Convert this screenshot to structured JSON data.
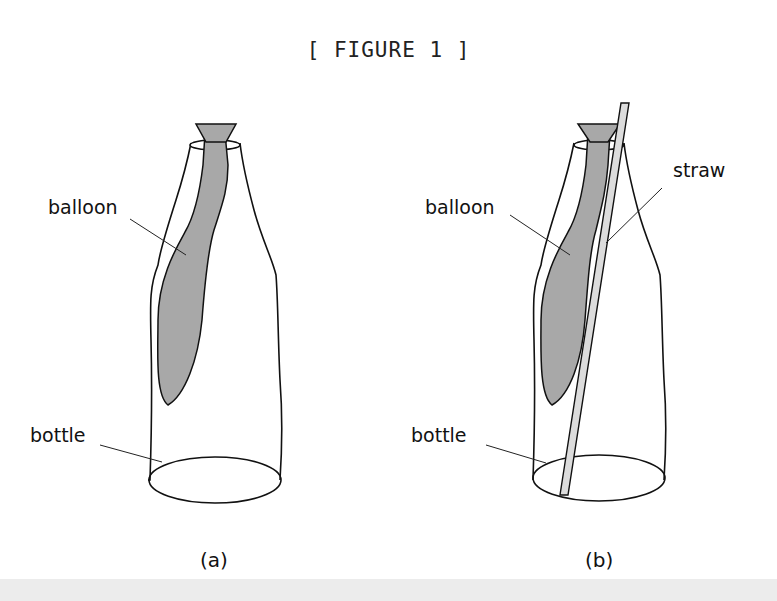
{
  "figure": {
    "title": "[ FIGURE 1 ]",
    "panels": [
      {
        "caption": "(a)",
        "labels": {
          "balloon": "balloon",
          "bottle": "bottle"
        }
      },
      {
        "caption": "(b)",
        "labels": {
          "balloon": "balloon",
          "straw": "straw",
          "bottle": "bottle"
        }
      }
    ]
  },
  "colors": {
    "balloon_fill": "#a8a8a8",
    "straw_fill": "#dcdcdc",
    "outline": "#111111"
  }
}
